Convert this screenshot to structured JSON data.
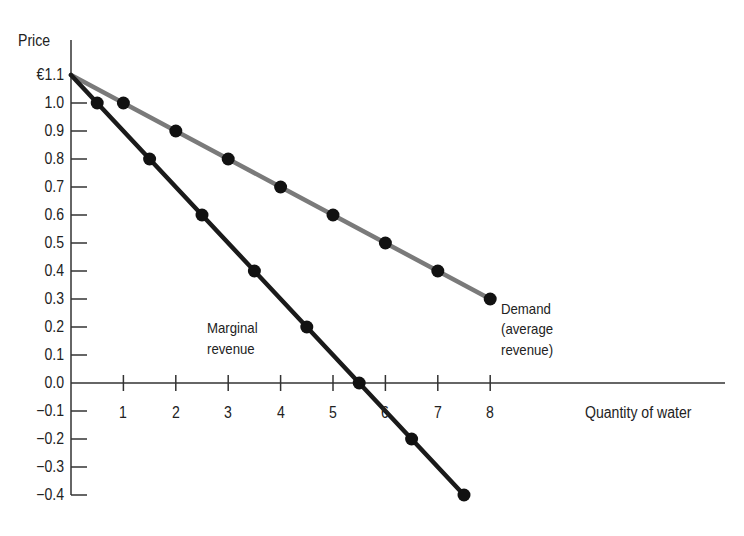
{
  "chart_data": {
    "type": "line",
    "title": "",
    "xlabel": "Quantity of water",
    "ylabel": "Price",
    "xlim": [
      0,
      12.8
    ],
    "ylim": [
      -0.4,
      1.1
    ],
    "grid": false,
    "y_ticks": [
      "€1.1",
      "1.0",
      "0.9",
      "0.8",
      "0.7",
      "0.6",
      "0.5",
      "0.4",
      "0.3",
      "0.2",
      "0.1",
      "0.0",
      "−0.1",
      "−0.2",
      "−0.3",
      "−0.4"
    ],
    "x_ticks": [
      "1",
      "2",
      "3",
      "4",
      "5",
      "6",
      "7",
      "8"
    ],
    "series": [
      {
        "name": "Demand (average revenue)",
        "color": "#7a7a7a",
        "line_start": {
          "x": 0,
          "y": 1.1
        },
        "x": [
          1,
          2,
          3,
          4,
          5,
          6,
          7,
          8
        ],
        "y": [
          1.0,
          0.9,
          0.8,
          0.7,
          0.6,
          0.5,
          0.4,
          0.3
        ]
      },
      {
        "name": "Marginal revenue",
        "color": "#1a1a1a",
        "line_start": {
          "x": 0,
          "y": 1.1
        },
        "x": [
          0.5,
          1.5,
          2.5,
          3.5,
          4.5,
          5.5,
          6.5,
          7.5
        ],
        "y": [
          1.0,
          0.8,
          0.6,
          0.4,
          0.2,
          0.0,
          -0.2,
          -0.4
        ]
      }
    ],
    "annotations": [
      {
        "text": "Marginal revenue",
        "near": "Marginal revenue line, x≈2.6–3.9, y≈0.1–0.2"
      },
      {
        "text": "Demand (average revenue)",
        "near": "end of demand line at x=8, y=0.3"
      }
    ]
  },
  "labels": {
    "y_axis_title": "Price",
    "x_axis_title": "Quantity of water",
    "mr_line1": "Marginal",
    "mr_line2": "revenue",
    "demand_line1": "Demand",
    "demand_line2": "(average",
    "demand_line3": "revenue)"
  }
}
